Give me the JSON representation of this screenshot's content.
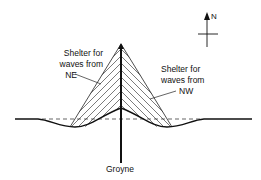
{
  "diagram": {
    "labels": {
      "ne_line1": "Shelter for",
      "ne_line2": "waves from",
      "ne_line3": "NE",
      "nw_line1": "Shelter for",
      "nw_line2": "waves from",
      "nw_line3": "NW",
      "groyne": "Groyne",
      "north": "N"
    },
    "colors": {
      "ink": "#111111",
      "background": "#ffffff"
    }
  }
}
